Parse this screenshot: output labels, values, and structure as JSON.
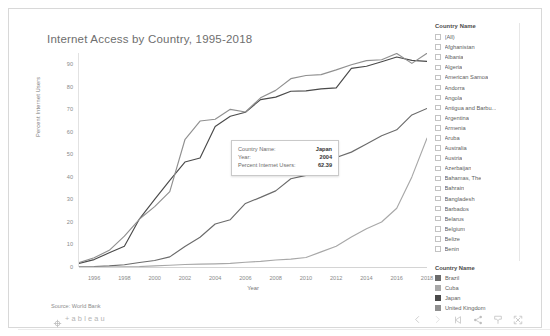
{
  "viz": {
    "title": "Internet Access by Country, 1995-2018",
    "source": "Source: World Bank",
    "logo_word": "+ableau"
  },
  "tooltip": {
    "rows": [
      {
        "key": "Country Name:",
        "value": "Japan"
      },
      {
        "key": "Year:",
        "value": "2004"
      },
      {
        "key": "Percent Internet Users:",
        "value": "62.39"
      }
    ]
  },
  "filter_panel": {
    "header": "Country Name",
    "items": [
      {
        "label": "(All)",
        "checked": false
      },
      {
        "label": "Afghanistan",
        "checked": false
      },
      {
        "label": "Albania",
        "checked": false
      },
      {
        "label": "Algeria",
        "checked": false
      },
      {
        "label": "American Samoa",
        "checked": false
      },
      {
        "label": "Andorra",
        "checked": false
      },
      {
        "label": "Angola",
        "checked": false
      },
      {
        "label": "Antigua and Barbu...",
        "checked": false
      },
      {
        "label": "Argentina",
        "checked": false
      },
      {
        "label": "Armenia",
        "checked": false
      },
      {
        "label": "Aruba",
        "checked": false
      },
      {
        "label": "Australia",
        "checked": false
      },
      {
        "label": "Austria",
        "checked": false
      },
      {
        "label": "Azerbaijan",
        "checked": false
      },
      {
        "label": "Bahamas, The",
        "checked": false
      },
      {
        "label": "Bahrain",
        "checked": false
      },
      {
        "label": "Bangladesh",
        "checked": false
      },
      {
        "label": "Barbados",
        "checked": false
      },
      {
        "label": "Belarus",
        "checked": false
      },
      {
        "label": "Belgium",
        "checked": false
      },
      {
        "label": "Belize",
        "checked": false
      },
      {
        "label": "Benin",
        "checked": false
      },
      {
        "label": "Bermuda",
        "checked": false
      },
      {
        "label": "Bhutan",
        "checked": false
      },
      {
        "label": "Bolivia",
        "checked": false
      }
    ]
  },
  "color_legend": {
    "header": "Country Name",
    "items": [
      {
        "label": "Brazil",
        "color": "#6b6b6b"
      },
      {
        "label": "Cuba",
        "color": "#a8a8a8"
      },
      {
        "label": "Japan",
        "color": "#4a4a4a"
      },
      {
        "label": "United Kingdom",
        "color": "#909090"
      }
    ]
  },
  "toolbar": {
    "buttons": [
      {
        "name": "back-icon",
        "label": "Back"
      },
      {
        "name": "forward-icon",
        "label": "Forward"
      },
      {
        "name": "revert-icon",
        "label": "Revert"
      },
      {
        "name": "share-icon",
        "label": "Share"
      },
      {
        "name": "download-icon",
        "label": "Download"
      },
      {
        "name": "fullscreen-icon",
        "label": "Full Screen"
      }
    ]
  },
  "chart_data": {
    "type": "line",
    "title": "Internet Access by Country, 1995-2018",
    "xlabel": "Year",
    "ylabel": "Percent Internet Users",
    "xlim": [
      1995,
      2018
    ],
    "ylim": [
      0,
      95
    ],
    "yticks": [
      0,
      10,
      20,
      30,
      40,
      50,
      60,
      70,
      80,
      90
    ],
    "xticks": [
      1996,
      1998,
      2000,
      2002,
      2004,
      2006,
      2008,
      2010,
      2012,
      2014,
      2016,
      2018
    ],
    "grid": false,
    "legend_position": "right",
    "x": [
      1995,
      1996,
      1997,
      1998,
      1999,
      2000,
      2001,
      2002,
      2003,
      2004,
      2005,
      2006,
      2007,
      2008,
      2009,
      2010,
      2011,
      2012,
      2013,
      2014,
      2015,
      2016,
      2017,
      2018
    ],
    "series": [
      {
        "name": "Japan",
        "color": "#4a4a4a",
        "values": [
          1.6,
          3.3,
          6.3,
          9.2,
          21.4,
          30.0,
          38.5,
          46.6,
          48.4,
          62.4,
          66.9,
          68.7,
          74.3,
          75.4,
          78.0,
          78.2,
          79.1,
          79.5,
          88.2,
          89.1,
          91.1,
          93.2,
          91.7,
          91.3
        ]
      },
      {
        "name": "United Kingdom",
        "color": "#909090",
        "values": [
          1.9,
          4.1,
          7.4,
          13.7,
          21.3,
          26.8,
          33.5,
          56.5,
          64.8,
          65.6,
          70.0,
          68.8,
          75.1,
          78.4,
          83.6,
          85.0,
          85.4,
          87.5,
          89.8,
          91.6,
          92.0,
          94.8,
          90.4,
          94.9
        ]
      },
      {
        "name": "Brazil",
        "color": "#6b6b6b",
        "values": [
          0.1,
          0.2,
          0.5,
          1.0,
          2.0,
          2.9,
          4.5,
          9.1,
          13.2,
          19.1,
          21.0,
          28.2,
          30.9,
          33.8,
          39.2,
          40.7,
          45.7,
          48.6,
          51.0,
          54.6,
          58.3,
          60.9,
          67.5,
          70.4
        ]
      },
      {
        "name": "Cuba",
        "color": "#a8a8a8",
        "values": [
          0.0,
          0.0,
          0.0,
          0.1,
          0.2,
          0.5,
          0.8,
          1.1,
          1.3,
          1.4,
          1.6,
          2.1,
          2.5,
          3.1,
          3.5,
          4.2,
          6.7,
          9.2,
          13.3,
          17.0,
          20.0,
          26.1,
          40.0,
          57.2
        ]
      }
    ]
  }
}
